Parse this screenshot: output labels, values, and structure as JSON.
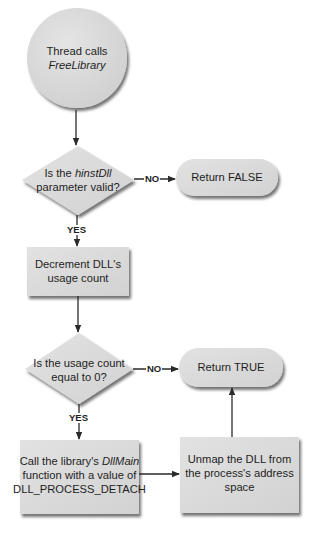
{
  "diagram": {
    "type": "flowchart",
    "colors": {
      "fill": "#d9d9d9",
      "fill_light": "#e6e6e6",
      "stroke": "#2a2a2a",
      "shadow": "#8c8c8c",
      "background": "#ffffff"
    },
    "nodes": {
      "start": {
        "shape": "circle",
        "line1": "Thread calls",
        "line2_italic": "FreeLibrary"
      },
      "decision1": {
        "shape": "diamond",
        "line1_prefix": "Is the ",
        "line1_italic": "hinstDll",
        "line2": "parameter valid?"
      },
      "return_false": {
        "shape": "pill",
        "label": "Return FALSE"
      },
      "decrement": {
        "shape": "rect",
        "line1": "Decrement DLL's",
        "line2": "usage count"
      },
      "decision2": {
        "shape": "diamond",
        "line1": "Is the usage count",
        "line2": "equal to 0?"
      },
      "return_true": {
        "shape": "pill",
        "label": "Return TRUE"
      },
      "call_dllmain": {
        "shape": "rect",
        "line1_prefix": "Call the library's ",
        "line1_italic": "DllMain",
        "line2": "function with a value of",
        "line3": "DLL_PROCESS_DETACH"
      },
      "unmap": {
        "shape": "rect",
        "line1": "Unmap the DLL from",
        "line2": "the process's address",
        "line3": "space"
      }
    },
    "edges": {
      "e1": {
        "from": "start",
        "to": "decision1",
        "label": ""
      },
      "e2": {
        "from": "decision1",
        "to": "return_false",
        "label": "NO"
      },
      "e3": {
        "from": "decision1",
        "to": "decrement",
        "label": "YES"
      },
      "e4": {
        "from": "decrement",
        "to": "decision2",
        "label": ""
      },
      "e5": {
        "from": "decision2",
        "to": "return_true",
        "label": "NO"
      },
      "e6": {
        "from": "decision2",
        "to": "call_dllmain",
        "label": "YES"
      },
      "e7": {
        "from": "call_dllmain",
        "to": "unmap",
        "label": ""
      },
      "e8": {
        "from": "unmap",
        "to": "return_true",
        "label": ""
      }
    }
  }
}
